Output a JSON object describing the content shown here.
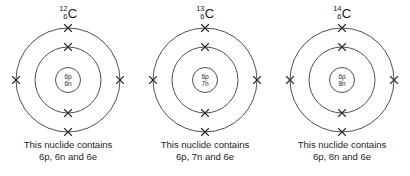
{
  "figure": {
    "background_color": "#ffffff",
    "stroke_color": "#3d3d3d",
    "text_color": "#1f1f1f"
  },
  "atoms": [
    {
      "mass_number": "12",
      "atomic_number": "6",
      "element_symbol": "C",
      "nucleus": {
        "protons_label": "6p",
        "neutrons_label": "6n"
      },
      "caption_line1": "This nuclide contains",
      "caption_line2": "6p, 6n and 6e",
      "inner_shell_electrons": 2,
      "outer_shell_electrons": 4
    },
    {
      "mass_number": "13",
      "atomic_number": "6",
      "element_symbol": "C",
      "nucleus": {
        "protons_label": "6p",
        "neutrons_label": "7n"
      },
      "caption_line1": "This nuclide contains",
      "caption_line2": "6p, 7n and 6e",
      "inner_shell_electrons": 2,
      "outer_shell_electrons": 4
    },
    {
      "mass_number": "14",
      "atomic_number": "6",
      "element_symbol": "C",
      "nucleus": {
        "protons_label": "6p",
        "neutrons_label": "8n"
      },
      "caption_line1": "This nuclide contains",
      "caption_line2": "6p, 8n and 6e",
      "inner_shell_electrons": 2,
      "outer_shell_electrons": 4
    }
  ]
}
